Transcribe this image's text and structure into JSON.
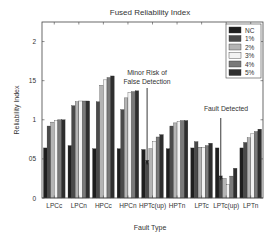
{
  "chart_data": {
    "type": "bar",
    "title": "Fused Reliability Index",
    "xlabel": "Fault Type",
    "ylabel": "Reliability Index",
    "ylim": [
      0,
      2.25
    ],
    "yticks": [
      0,
      0.5,
      1,
      1.5,
      2
    ],
    "ytick_labels": [
      "0",
      "05",
      "1",
      "15",
      "2"
    ],
    "grid": false,
    "legend_position": "top-right",
    "categories": [
      "LPCc",
      "LPCn",
      "HPCc",
      "HPCn",
      "HPTc(up)",
      "HPTn",
      "LPTc",
      "LPTc(up)",
      "LPTn"
    ],
    "series": [
      {
        "name": "NC",
        "color": "#1e1e1e",
        "values": [
          0.64,
          0.67,
          0.63,
          0.63,
          0.62,
          0.63,
          0.64,
          0.64,
          0.64
        ]
      },
      {
        "name": "1%",
        "color": "#4a4a4a",
        "values": [
          0.92,
          1.18,
          1.23,
          1.13,
          0.45,
          0.92,
          0.72,
          0.26,
          0.71
        ]
      },
      {
        "name": "2%",
        "color": "#b4b4b4",
        "values": [
          0.97,
          1.23,
          1.44,
          1.28,
          0.63,
          0.96,
          0.65,
          0.25,
          0.77
        ]
      },
      {
        "name": "3%",
        "color": "#f2f2f2",
        "values": [
          0.99,
          1.24,
          1.51,
          1.35,
          0.72,
          0.98,
          0.65,
          0.17,
          0.82
        ]
      },
      {
        "name": "4%",
        "color": "#7a7a7a",
        "values": [
          1.0,
          1.24,
          1.54,
          1.36,
          0.78,
          0.99,
          0.67,
          0.28,
          0.85
        ]
      },
      {
        "name": "5%",
        "color": "#2e2e2e",
        "values": [
          1.0,
          1.24,
          1.56,
          1.37,
          0.81,
          0.99,
          0.7,
          0.38,
          0.88
        ]
      }
    ],
    "annotations": [
      {
        "lines": [
          "Minor Risk of",
          "False Detection"
        ],
        "category": "HPTc(up)",
        "arrow_to_value": 0.42
      },
      {
        "lines": [
          "Fault Detected"
        ],
        "category": "LPTc(up)",
        "arrow_to_value": 0.22
      }
    ]
  }
}
